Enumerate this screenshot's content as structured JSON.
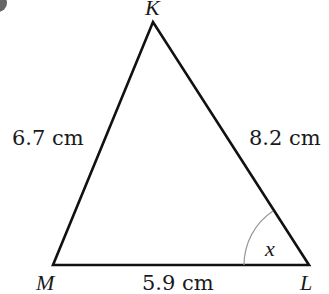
{
  "diagram": {
    "type": "triangle",
    "vertices": {
      "K": {
        "label": "K"
      },
      "M": {
        "label": "M"
      },
      "L": {
        "label": "L"
      }
    },
    "sides": {
      "KM": {
        "label": "6.7 cm",
        "value": 6.7,
        "unit": "cm"
      },
      "KL": {
        "label": "8.2 cm",
        "value": 8.2,
        "unit": "cm"
      },
      "ML": {
        "label": "5.9 cm",
        "value": 5.9,
        "unit": "cm"
      }
    },
    "angle": {
      "vertex": "L",
      "label": "x"
    },
    "colors": {
      "line": "#111111",
      "arc": "#999999",
      "corner_marker": "#666666"
    }
  }
}
